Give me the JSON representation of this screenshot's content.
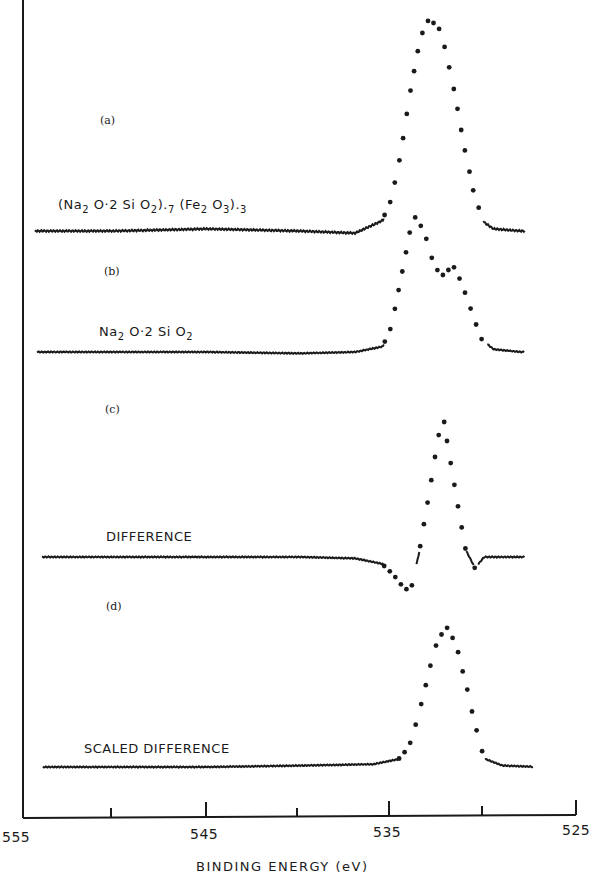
{
  "chart_data": {
    "type": "line",
    "title": "",
    "xlabel": "BINDING ENERGY (eV)",
    "ylabel": "",
    "xlim": [
      555,
      525
    ],
    "x_reversed": true,
    "xticks": [
      555,
      550,
      545,
      540,
      535,
      530,
      525
    ],
    "xtick_labels": [
      "555",
      "545",
      "535",
      "525"
    ],
    "grid": false,
    "legend": "none (inline labels)",
    "panels": [
      {
        "id": "(a)",
        "label": "(Na2O·2SiO2).7 (Fe2O3).3",
        "style": "solid baseline + dotted peak",
        "peak_be_eV": 532.9,
        "x": [
          554,
          550,
          545,
          540,
          537,
          535.5,
          535,
          534.5,
          534,
          533.5,
          533,
          532.5,
          532,
          531.5,
          531,
          530.5,
          530,
          529.5,
          528
        ],
        "y": [
          0.0,
          0.0,
          0.01,
          0.0,
          -0.01,
          0.05,
          0.16,
          0.38,
          0.66,
          0.9,
          1.0,
          0.97,
          0.82,
          0.6,
          0.36,
          0.15,
          0.04,
          0.01,
          0.0
        ]
      },
      {
        "id": "(b)",
        "label": "Na2O·2SiO2",
        "style": "solid baseline + dotted peak",
        "peak_be_eV": 533.7,
        "shoulder_be_eV": 531.6,
        "x": [
          554,
          550,
          545,
          540,
          537,
          535.5,
          535,
          534.5,
          534,
          533.7,
          533.2,
          532.7,
          532.2,
          531.7,
          531.2,
          530.7,
          530.2,
          529.5,
          528
        ],
        "y": [
          0.0,
          0.0,
          0.0,
          -0.01,
          0.0,
          0.04,
          0.2,
          0.55,
          0.9,
          1.0,
          0.85,
          0.62,
          0.56,
          0.63,
          0.5,
          0.3,
          0.1,
          0.02,
          0.0
        ]
      },
      {
        "id": "(c)",
        "label": "DIFFERENCE",
        "style": "solid baseline + dotted peak",
        "peak_be_eV": 532.3,
        "min_be_eV": 534.0,
        "x": [
          554,
          550,
          545,
          540,
          537,
          535.5,
          535,
          534.5,
          534,
          533.5,
          533,
          532.5,
          532.2,
          532,
          531.5,
          531,
          530.5,
          530,
          528
        ],
        "y": [
          0.0,
          0.0,
          0.0,
          0.0,
          -0.01,
          -0.05,
          -0.12,
          -0.2,
          -0.25,
          0.05,
          0.45,
          0.86,
          1.0,
          0.82,
          0.42,
          0.05,
          -0.08,
          0.0,
          0.0
        ]
      },
      {
        "id": "(d)",
        "label": "SCALED DIFFERENCE",
        "style": "solid baseline + dotted peak",
        "peak_be_eV": 532.0,
        "x": [
          554,
          550,
          545,
          540,
          536,
          534.5,
          534,
          533.5,
          533,
          532.5,
          532,
          531.5,
          531,
          530.5,
          530,
          529,
          527
        ],
        "y": [
          0.0,
          0.0,
          0.0,
          0.01,
          0.02,
          0.06,
          0.18,
          0.4,
          0.68,
          0.92,
          1.0,
          0.86,
          0.6,
          0.3,
          0.06,
          0.01,
          0.0
        ]
      }
    ]
  },
  "labels": {
    "panel_a": "(a)",
    "panel_b": "(b)",
    "panel_c": "(c)",
    "panel_d": "(d)",
    "trace_a": {
      "p1": "(Na",
      "s1": "2",
      "p2": " O·2 Si O",
      "s2": "2",
      "p3": ").",
      "s3": "7",
      "p4": " (Fe",
      "s4": "2",
      "p5": " O",
      "s5": "3",
      "p6": ").",
      "s6": "3"
    },
    "trace_b": {
      "p1": "Na",
      "s1": "2",
      "p2": " O·2 Si O",
      "s2": "2"
    },
    "trace_c": "DIFFERENCE",
    "trace_d": "SCALED DIFFERENCE",
    "tick_555": "555",
    "tick_545": "545",
    "tick_535": "535",
    "tick_525": "525",
    "x_axis_title": "BINDING ENERGY (eV)"
  },
  "colors": {
    "ink": "#1a1a1a",
    "background": "#ffffff"
  }
}
